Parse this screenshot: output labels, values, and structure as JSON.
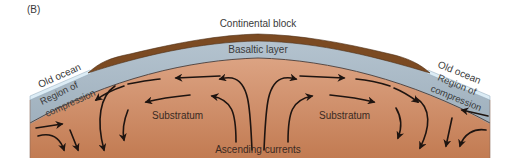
{
  "figure": {
    "panel_label": "(B)",
    "labels": {
      "continental_block": "Continental block",
      "basaltic_layer": "Basaltic layer",
      "old_ocean_left": "Old ocean",
      "old_ocean_right": "Old ocean",
      "compression_left_line1": "Region of",
      "compression_left_line2": "compression",
      "compression_right_line1": "Region of",
      "compression_right_line2": "compression",
      "substratum_left": "Substratum",
      "substratum_right": "Substratum",
      "ascending_currents": "Ascending currents"
    },
    "colors": {
      "continental_block": "#7a4a24",
      "basaltic_layer": "#a9b9c6",
      "old_ocean": "#d9e9f2",
      "substratum_top": "#d99f7e",
      "substratum_bottom": "#c07a52",
      "arrows": "#1e1410",
      "text": "#3a3a3a"
    }
  }
}
